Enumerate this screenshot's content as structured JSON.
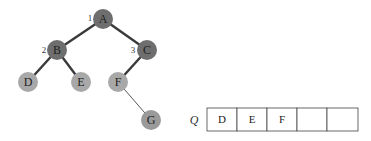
{
  "diagram": {
    "type": "binary-tree-bfs",
    "colors": {
      "visited_node": "#6e6e6e",
      "frontier_node": "#a8a8a8",
      "pending_node": "#9a9a9a",
      "thick_edge": "#3a3a3a",
      "thin_edge": "#555555"
    },
    "nodes": [
      {
        "id": "A",
        "label": "A",
        "cx": 103,
        "cy": 19,
        "state": "visited",
        "order": "1"
      },
      {
        "id": "B",
        "label": "B",
        "cx": 57,
        "cy": 50,
        "state": "visited",
        "order": "2"
      },
      {
        "id": "C",
        "label": "C",
        "cx": 147,
        "cy": 50,
        "state": "visited",
        "order": "3"
      },
      {
        "id": "D",
        "label": "D",
        "cx": 28,
        "cy": 82,
        "state": "frontier"
      },
      {
        "id": "E",
        "label": "E",
        "cx": 81,
        "cy": 82,
        "state": "frontier"
      },
      {
        "id": "F",
        "label": "F",
        "cx": 118,
        "cy": 82,
        "state": "frontier"
      },
      {
        "id": "G",
        "label": "G",
        "cx": 151,
        "cy": 120,
        "state": "pending"
      }
    ],
    "edges": [
      {
        "from": "A",
        "to": "B",
        "style": "thick"
      },
      {
        "from": "A",
        "to": "C",
        "style": "thick"
      },
      {
        "from": "B",
        "to": "D",
        "style": "thick"
      },
      {
        "from": "B",
        "to": "E",
        "style": "thick"
      },
      {
        "from": "C",
        "to": "F",
        "style": "thick"
      },
      {
        "from": "F",
        "to": "G",
        "style": "thin"
      }
    ],
    "queue": {
      "label": "Q",
      "cells": [
        "D",
        "E",
        "F",
        "",
        ""
      ]
    }
  }
}
